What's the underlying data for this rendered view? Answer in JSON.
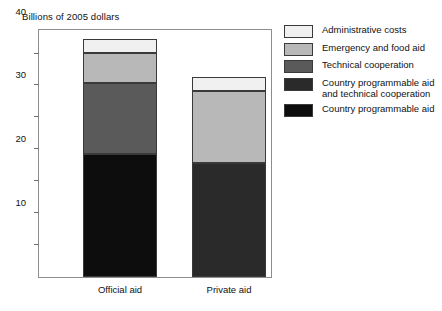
{
  "chart_data": {
    "type": "bar",
    "subtype": "stacked-bar",
    "title": "Billions of 2005 dollars",
    "xlabel": "",
    "ylabel": "",
    "categories": [
      "Official aid",
      "Private aid"
    ],
    "ylim": [
      0,
      78
    ],
    "yticks": [
      10,
      20,
      30,
      40,
      50,
      60,
      70
    ],
    "ytick_labels": [
      "10",
      "20",
      "30",
      "40",
      "50",
      "60",
      "70"
    ],
    "grid": false,
    "legend_position": "right",
    "series": [
      {
        "name": "Country programmable aid",
        "color": "#0d0d0d",
        "values": [
          38.5,
          0
        ]
      },
      {
        "name": "Country programmable aid and technical cooperation",
        "color": "#2a2a2a",
        "values": [
          0,
          35.8
        ]
      },
      {
        "name": "Technical cooperation",
        "color": "#5a5a5a",
        "values": [
          22.3,
          0
        ]
      },
      {
        "name": "Emergency and food aid",
        "color": "#b8b8b8",
        "values": [
          9.5,
          22.5
        ]
      },
      {
        "name": "Administrative costs",
        "color": "#f0f0f0",
        "values": [
          4.2,
          4.2
        ]
      }
    ],
    "totals": [
      74.5,
      62.5
    ],
    "legend": [
      {
        "label": "Administrative costs",
        "color": "#f0f0f0"
      },
      {
        "label": "Emergency and food aid",
        "color": "#b8b8b8"
      },
      {
        "label": "Technical cooperation",
        "color": "#5a5a5a"
      },
      {
        "label": "Country programmable aid\nand technical cooperation",
        "color": "#2a2a2a"
      },
      {
        "label": "Country programmable aid",
        "color": "#0d0d0d"
      }
    ]
  },
  "axis": {
    "frame_color": "#8d8d8d",
    "tick_color": "#6f6f6f"
  }
}
